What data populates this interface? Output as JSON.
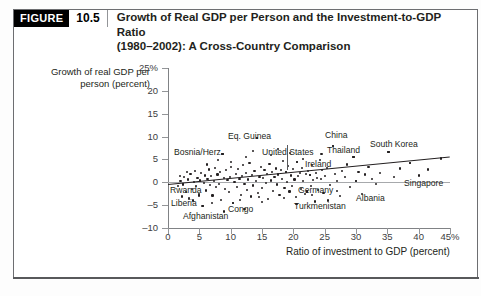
{
  "figure": {
    "badge": "FIGURE",
    "number": "10.5",
    "title_line1": "Growth of Real GDP per Person and the Investment-to-GDP Ratio",
    "title_line2": "(1980–2002): A Cross-Country Comparison"
  },
  "colors": {
    "badge_bg": "#000000",
    "badge_text": "#ffffff",
    "axis": "#808285",
    "dot": "#231f20",
    "trendline": "#231f20",
    "zeroline": "#a7a9ac",
    "frame": "#6d6e71"
  },
  "chart_data": {
    "type": "scatter",
    "title": "Growth of Real GDP per Person and the Investment-to-GDP Ratio (1980–2002): A Cross-Country Comparison",
    "xlabel": "Ratio of investment to GDP (percent)",
    "ylabel": "Growth of real GDP per person (percent)",
    "xlim": [
      0,
      45
    ],
    "ylim": [
      -10,
      25
    ],
    "grid": false,
    "legend": "none",
    "xticks": [
      0,
      5,
      10,
      15,
      20,
      25,
      30,
      35,
      40,
      45
    ],
    "xticklabels": [
      "0",
      "5",
      "10",
      "15",
      "20",
      "25",
      "30",
      "35",
      "40",
      "45%"
    ],
    "yticks": [
      -10,
      -5,
      0,
      5,
      10,
      15,
      20,
      25
    ],
    "yticklabels": [
      "–10",
      "–5",
      "0",
      "5",
      "10",
      "15",
      "20",
      "25%"
    ],
    "zero_reference_line": 0,
    "trendline": {
      "x0": 0,
      "y0": -0.4,
      "x1": 45,
      "y1": 5.6
    },
    "annotations": [
      {
        "label": "Bosnia/Herz",
        "x": 7.0,
        "y": 8.2,
        "px": 174,
        "py": 148,
        "dot_x": 8.7,
        "dot_y": 6.1
      },
      {
        "label": "Eq. Guinea",
        "x": 13.0,
        "y": 11.6,
        "px": 228,
        "py": 132,
        "dot_x": 14.2,
        "dot_y": 9.6
      },
      {
        "label": "United States",
        "x": 17.6,
        "y": 9.3,
        "px": 262,
        "py": 148,
        "dot_x": 18.8,
        "dot_y": 2.2
      },
      {
        "label": "Ireland",
        "x": 21.0,
        "y": 7.0,
        "px": 305,
        "py": 160,
        "dot_x": 20.6,
        "dot_y": 4.4
      },
      {
        "label": "China",
        "x": 25.5,
        "y": 11.8,
        "px": 325,
        "py": 131,
        "dot_x": 26.3,
        "dot_y": 8.0
      },
      {
        "label": "Thailand",
        "x": 28.0,
        "y": 9.2,
        "px": 327,
        "py": 146,
        "dot_x": 29.6,
        "dot_y": 5.6
      },
      {
        "label": "South Korea",
        "x": 33.5,
        "y": 10.0,
        "px": 370,
        "py": 140,
        "dot_x": 35.2,
        "dot_y": 6.6
      },
      {
        "label": "Singapore",
        "x": 37.5,
        "y": 2.5,
        "px": 404,
        "py": 179,
        "dot_x": 38.6,
        "dot_y": 4.2
      },
      {
        "label": "Germany",
        "x": 21.0,
        "y": -1.2,
        "px": 298,
        "py": 186,
        "dot_x": 22.6,
        "dot_y": 1.6
      },
      {
        "label": "Albania",
        "x": 28.3,
        "y": -2.4,
        "px": 356,
        "py": 194,
        "dot_x": 30.0,
        "dot_y": 0.3
      },
      {
        "label": "Turkmenistan",
        "x": 20.0,
        "y": -3.6,
        "px": 294,
        "py": 202,
        "dot_x": 22.2,
        "dot_y": -2.0
      },
      {
        "label": "Rwanda",
        "x": 1.0,
        "y": -1.2,
        "px": 170,
        "py": 186,
        "dot_x": 2.4,
        "dot_y": -0.4
      },
      {
        "label": "Liberia",
        "x": 1.2,
        "y": -4.1,
        "px": 171,
        "py": 199,
        "dot_x": 3.4,
        "dot_y": -3.6
      },
      {
        "label": "Afghanistan",
        "x": 2.8,
        "y": -6.4,
        "px": 183,
        "py": 212,
        "dot_x": 5.6,
        "dot_y": -5.2
      },
      {
        "label": "Congo",
        "x": 11.0,
        "y": -5.0,
        "px": 228,
        "py": 205,
        "dot_x": 10.4,
        "dot_y": -4.5
      }
    ],
    "points": [
      [
        1.6,
        -0.9
      ],
      [
        2.0,
        0.3
      ],
      [
        2.4,
        -0.5
      ],
      [
        2.6,
        1.2
      ],
      [
        2.9,
        -2.1
      ],
      [
        3.2,
        0.6
      ],
      [
        3.4,
        -3.4
      ],
      [
        3.6,
        1.9
      ],
      [
        3.8,
        -1.4
      ],
      [
        4.1,
        0.1
      ],
      [
        4.3,
        2.4
      ],
      [
        4.5,
        -0.8
      ],
      [
        4.7,
        1.0
      ],
      [
        4.9,
        -2.6
      ],
      [
        5.1,
        0.4
      ],
      [
        5.3,
        2.0
      ],
      [
        5.5,
        -5.1
      ],
      [
        5.7,
        -0.2
      ],
      [
        5.9,
        1.5
      ],
      [
        6.1,
        -1.8
      ],
      [
        6.3,
        0.8
      ],
      [
        6.5,
        2.8
      ],
      [
        6.7,
        -0.6
      ],
      [
        6.9,
        1.3
      ],
      [
        7.1,
        -2.9
      ],
      [
        7.3,
        0.2
      ],
      [
        7.5,
        3.1
      ],
      [
        7.7,
        -1.1
      ],
      [
        7.9,
        1.7
      ],
      [
        8.1,
        -0.3
      ],
      [
        8.3,
        2.2
      ],
      [
        8.5,
        -3.8
      ],
      [
        8.7,
        6.1
      ],
      [
        8.9,
        0.9
      ],
      [
        9.1,
        -1.5
      ],
      [
        9.3,
        2.6
      ],
      [
        9.5,
        0.5
      ],
      [
        9.7,
        -2.2
      ],
      [
        9.9,
        1.1
      ],
      [
        10.1,
        3.4
      ],
      [
        10.4,
        -4.5
      ],
      [
        10.6,
        0.0
      ],
      [
        10.8,
        1.8
      ],
      [
        11.0,
        -1.0
      ],
      [
        11.2,
        2.9
      ],
      [
        11.4,
        0.7
      ],
      [
        11.6,
        -2.7
      ],
      [
        11.8,
        1.4
      ],
      [
        12.0,
        3.8
      ],
      [
        12.2,
        -0.4
      ],
      [
        12.4,
        2.1
      ],
      [
        12.6,
        -1.7
      ],
      [
        12.8,
        0.6
      ],
      [
        13.0,
        4.2
      ],
      [
        13.2,
        -3.1
      ],
      [
        13.4,
        1.6
      ],
      [
        13.6,
        -0.7
      ],
      [
        13.8,
        2.5
      ],
      [
        14.0,
        0.3
      ],
      [
        14.2,
        9.6
      ],
      [
        14.4,
        -2.4
      ],
      [
        14.6,
        1.2
      ],
      [
        14.8,
        3.3
      ],
      [
        15.0,
        -1.3
      ],
      [
        15.2,
        0.9
      ],
      [
        15.4,
        2.7
      ],
      [
        15.6,
        -0.1
      ],
      [
        15.8,
        1.9
      ],
      [
        16.0,
        -3.6
      ],
      [
        16.2,
        4.0
      ],
      [
        16.4,
        0.4
      ],
      [
        16.6,
        2.3
      ],
      [
        16.8,
        -1.9
      ],
      [
        17.0,
        1.1
      ],
      [
        17.2,
        3.0
      ],
      [
        17.4,
        -0.5
      ],
      [
        17.6,
        1.7
      ],
      [
        17.8,
        -2.8
      ],
      [
        18.0,
        2.6
      ],
      [
        18.2,
        0.8
      ],
      [
        18.4,
        4.6
      ],
      [
        18.6,
        -1.2
      ],
      [
        18.8,
        2.2
      ],
      [
        19.0,
        0.1
      ],
      [
        19.2,
        3.5
      ],
      [
        19.4,
        -2.0
      ],
      [
        19.6,
        1.5
      ],
      [
        19.8,
        -0.8
      ],
      [
        20.0,
        2.9
      ],
      [
        20.2,
        0.6
      ],
      [
        20.4,
        -3.3
      ],
      [
        20.6,
        4.4
      ],
      [
        20.8,
        1.3
      ],
      [
        21.0,
        2.0
      ],
      [
        21.2,
        -1.5
      ],
      [
        21.4,
        3.2
      ],
      [
        21.6,
        0.2
      ],
      [
        21.8,
        -2.5
      ],
      [
        22.0,
        1.8
      ],
      [
        22.2,
        -2.0
      ],
      [
        22.4,
        2.4
      ],
      [
        22.6,
        1.6
      ],
      [
        22.8,
        -0.9
      ],
      [
        23.0,
        3.7
      ],
      [
        23.2,
        0.5
      ],
      [
        23.4,
        -4.2
      ],
      [
        23.6,
        2.1
      ],
      [
        23.8,
        1.0
      ],
      [
        24.0,
        -1.6
      ],
      [
        24.2,
        4.8
      ],
      [
        24.4,
        0.7
      ],
      [
        24.6,
        2.7
      ],
      [
        24.8,
        -2.3
      ],
      [
        25.0,
        1.4
      ],
      [
        25.4,
        3.1
      ],
      [
        25.8,
        -0.6
      ],
      [
        26.3,
        8.0
      ],
      [
        26.6,
        1.9
      ],
      [
        27.0,
        0.3
      ],
      [
        27.4,
        -3.0
      ],
      [
        27.8,
        2.5
      ],
      [
        28.2,
        1.1
      ],
      [
        28.6,
        3.9
      ],
      [
        29.0,
        -1.1
      ],
      [
        29.6,
        5.6
      ],
      [
        30.0,
        0.3
      ],
      [
        30.4,
        2.2
      ],
      [
        30.9,
        -2.6
      ],
      [
        31.4,
        1.7
      ],
      [
        32.0,
        3.4
      ],
      [
        32.6,
        0.8
      ],
      [
        33.2,
        -0.4
      ],
      [
        33.8,
        2.0
      ],
      [
        35.2,
        6.6
      ],
      [
        36.0,
        1.2
      ],
      [
        37.0,
        3.0
      ],
      [
        38.6,
        4.2
      ],
      [
        40.0,
        1.5
      ],
      [
        41.5,
        2.8
      ],
      [
        43.5,
        5.2
      ],
      [
        8.0,
        4.9
      ],
      [
        12.5,
        5.6
      ],
      [
        16.5,
        5.9
      ],
      [
        19.5,
        6.4
      ],
      [
        24.5,
        6.2
      ],
      [
        6.2,
        3.9
      ],
      [
        10.0,
        4.4
      ],
      [
        13.5,
        6.8
      ],
      [
        17.5,
        7.2
      ],
      [
        21.5,
        5.1
      ],
      [
        9.0,
        -6.4
      ],
      [
        12.2,
        -5.8
      ],
      [
        7.0,
        -4.6
      ],
      [
        4.0,
        -4.0
      ],
      [
        5.0,
        -2.9
      ],
      [
        2.2,
        -3.1
      ],
      [
        15.0,
        -4.4
      ],
      [
        18.5,
        -3.4
      ],
      [
        25.5,
        -4.0
      ],
      [
        11.5,
        -3.9
      ],
      [
        14.5,
        -3.2
      ],
      [
        20.5,
        -4.8
      ],
      [
        23.0,
        -2.8
      ],
      [
        27.0,
        -1.9
      ],
      [
        3.0,
        2.2
      ],
      [
        1.9,
        1.4
      ]
    ]
  }
}
